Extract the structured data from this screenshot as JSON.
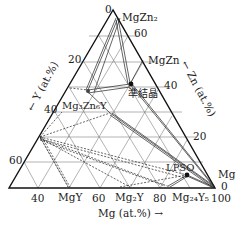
{
  "diagram": {
    "type": "ternary-phase-diagram",
    "system": "Mg-Zn-Y",
    "axes": {
      "bottom": {
        "label": "Mg (at.%) →",
        "ticks": [
          "40",
          "60",
          "80",
          "100"
        ]
      },
      "left": {
        "label": "← Y (at.%)",
        "ticks": [
          "0",
          "20",
          "40",
          "60"
        ]
      },
      "right": {
        "label": "← Zn (at.%)",
        "ticks": [
          "60",
          "40",
          "20",
          "0"
        ]
      }
    },
    "phases": [
      {
        "name": "MgZn2",
        "label": "MgZn₂"
      },
      {
        "name": "MgZn",
        "label": "MgZn"
      },
      {
        "name": "quasicrystal",
        "label": "準結晶"
      },
      {
        "name": "Mg3Zn6Y",
        "label": "Mg₃Zn₆Y"
      },
      {
        "name": "LPSO",
        "label": "LPSO"
      },
      {
        "name": "Mg",
        "label": "Mg"
      },
      {
        "name": "MgY",
        "label": "MgY"
      },
      {
        "name": "Mg2Y",
        "label": "Mg₂Y"
      },
      {
        "name": "Mg24Y5",
        "label": "Mg₂₄Y₅"
      }
    ],
    "colors": {
      "line": "#222222",
      "grid": "#555555",
      "background": "#ffffff"
    }
  }
}
